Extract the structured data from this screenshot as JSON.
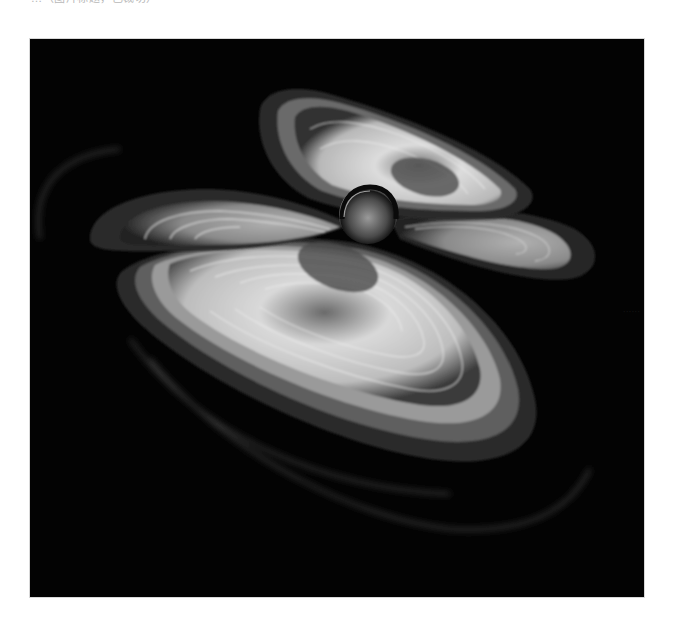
{
  "caption": {
    "text": "…（图片标题，已裁切）"
  },
  "figure": {
    "background_color": "#030303",
    "glow_color": "#e6e6e6",
    "elements": [
      {
        "name": "central-sphere",
        "cx": 338,
        "cy": 174,
        "r": 28
      },
      {
        "name": "upper-lobe",
        "cx": 390,
        "cy": 136
      },
      {
        "name": "left-lobe",
        "cx": 190,
        "cy": 186
      },
      {
        "name": "right-lobe",
        "cx": 490,
        "cy": 196
      },
      {
        "name": "lower-lobe",
        "cx": 310,
        "cy": 262
      }
    ]
  },
  "watermark": {
    "text": "······"
  }
}
